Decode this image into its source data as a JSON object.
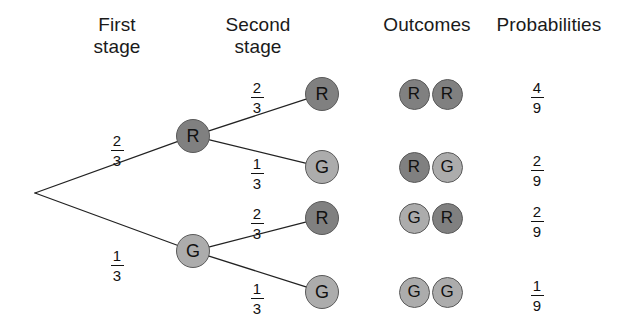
{
  "diagram": {
    "type": "probability-tree",
    "headers": [
      {
        "id": "first-stage",
        "label": "First\nstage",
        "x": 117,
        "y": 14
      },
      {
        "id": "second-stage",
        "label": "Second\nstage",
        "x": 258,
        "y": 14
      },
      {
        "id": "outcomes",
        "label": "Outcomes",
        "x": 427,
        "y": 14
      },
      {
        "id": "probabilities",
        "label": "Probabilities",
        "x": 549,
        "y": 14
      }
    ],
    "colors": {
      "red_node": "#808080",
      "green_node": "#acacac",
      "edge": "#222222",
      "text": "#1a1a1a",
      "background": "#ffffff"
    },
    "root": {
      "x": 35,
      "y": 193
    },
    "stage1_nodes": [
      {
        "id": "stage1-R",
        "label": "R",
        "kind": "R",
        "x": 193,
        "y": 136
      },
      {
        "id": "stage1-G",
        "label": "G",
        "kind": "G",
        "x": 193,
        "y": 251
      }
    ],
    "stage2_nodes": [
      {
        "id": "stage2-R-R",
        "label": "R",
        "kind": "R",
        "x": 322,
        "y": 94
      },
      {
        "id": "stage2-R-G",
        "label": "G",
        "kind": "G",
        "x": 322,
        "y": 167
      },
      {
        "id": "stage2-G-R",
        "label": "R",
        "kind": "R",
        "x": 322,
        "y": 218
      },
      {
        "id": "stage2-G-G",
        "label": "G",
        "kind": "G",
        "x": 322,
        "y": 292
      }
    ],
    "edges": [
      {
        "id": "edge-root-R",
        "from": [
          35,
          193
        ],
        "to": [
          193,
          136
        ]
      },
      {
        "id": "edge-root-G",
        "from": [
          35,
          193
        ],
        "to": [
          193,
          251
        ]
      },
      {
        "id": "edge-R-R",
        "from": [
          193,
          136
        ],
        "to": [
          322,
          94
        ]
      },
      {
        "id": "edge-R-G",
        "from": [
          193,
          136
        ],
        "to": [
          322,
          167
        ]
      },
      {
        "id": "edge-G-R",
        "from": [
          193,
          251
        ],
        "to": [
          322,
          218
        ]
      },
      {
        "id": "edge-G-G",
        "from": [
          193,
          251
        ],
        "to": [
          322,
          292
        ]
      }
    ],
    "branch_labels": [
      {
        "id": "branch-prob-first-R",
        "numerator": "2",
        "denominator": "3",
        "x": 117,
        "y": 133,
        "stage": "first",
        "branch": "R"
      },
      {
        "id": "branch-prob-first-G",
        "numerator": "1",
        "denominator": "3",
        "x": 117,
        "y": 248,
        "stage": "first",
        "branch": "G"
      },
      {
        "id": "branch-prob-second-RR",
        "numerator": "2",
        "denominator": "3",
        "x": 257,
        "y": 80,
        "stage": "second",
        "branch": "RR"
      },
      {
        "id": "branch-prob-second-RG",
        "numerator": "1",
        "denominator": "3",
        "x": 257,
        "y": 156,
        "stage": "second",
        "branch": "RG"
      },
      {
        "id": "branch-prob-second-GR",
        "numerator": "2",
        "denominator": "3",
        "x": 257,
        "y": 206,
        "stage": "second",
        "branch": "GR"
      },
      {
        "id": "branch-prob-second-GG",
        "numerator": "1",
        "denominator": "3",
        "x": 257,
        "y": 281,
        "stage": "second",
        "branch": "GG"
      }
    ],
    "outcomes": [
      {
        "id": "outcome-RR",
        "pair": [
          {
            "label": "R",
            "kind": "R"
          },
          {
            "label": "R",
            "kind": "R"
          }
        ],
        "y": 94,
        "probability": {
          "numerator": "4",
          "denominator": "9"
        }
      },
      {
        "id": "outcome-RG",
        "pair": [
          {
            "label": "R",
            "kind": "R"
          },
          {
            "label": "G",
            "kind": "G"
          }
        ],
        "y": 167,
        "probability": {
          "numerator": "2",
          "denominator": "9"
        }
      },
      {
        "id": "outcome-GR",
        "pair": [
          {
            "label": "G",
            "kind": "G"
          },
          {
            "label": "R",
            "kind": "R"
          }
        ],
        "y": 218,
        "probability": {
          "numerator": "2",
          "denominator": "9"
        }
      },
      {
        "id": "outcome-GG",
        "pair": [
          {
            "label": "G",
            "kind": "G"
          },
          {
            "label": "G",
            "kind": "G"
          }
        ],
        "y": 292,
        "probability": {
          "numerator": "1",
          "denominator": "9"
        }
      }
    ],
    "outcome_columns": {
      "left_x": 414,
      "right_x": 447,
      "prob_x": 537
    }
  }
}
